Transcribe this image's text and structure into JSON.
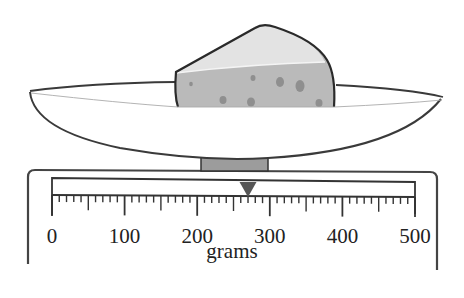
{
  "figure": {
    "object_on_scale": "cheese wedge",
    "reading_grams": 270
  },
  "scale": {
    "unit_label": "grams",
    "min": 0,
    "max": 500,
    "major_step": 100,
    "medium_step": 50,
    "minor_step": 10,
    "tick_labels": [
      "0",
      "100",
      "200",
      "300",
      "400",
      "500"
    ],
    "pointer_value": 270
  },
  "colors": {
    "outline": "#333333",
    "cheese_face": "#e2e2e2",
    "cheese_side": "#b9b9b9",
    "cheese_holes": "#8f8f8f",
    "stem": "#9c9c9c",
    "pointer": "#555555"
  }
}
